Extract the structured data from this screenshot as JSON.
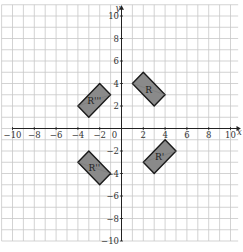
{
  "diagram": {
    "type": "coordinate-grid",
    "x_axis_label": "x",
    "y_axis_label": "y",
    "x_range": [
      -10,
      10
    ],
    "y_range": [
      -10,
      10
    ],
    "x_tick_labels": [
      "−10",
      "−8",
      "−6",
      "−4",
      "−2",
      "0",
      "2",
      "4",
      "6",
      "8",
      "10"
    ],
    "y_tick_labels": [
      "10",
      "8",
      "6",
      "4",
      "2",
      "−2",
      "−4",
      "−6",
      "−8",
      "−10"
    ],
    "shapes": [
      {
        "label": "R",
        "vertices": [
          [
            1,
            4
          ],
          [
            2,
            5
          ],
          [
            4,
            3
          ],
          [
            3,
            2
          ]
        ]
      },
      {
        "label": "R'''",
        "vertices": [
          [
            -4,
            2
          ],
          [
            -2,
            4
          ],
          [
            -1,
            3
          ],
          [
            -3,
            1
          ]
        ]
      },
      {
        "label": "R''",
        "vertices": [
          [
            -4,
            -3
          ],
          [
            -3,
            -2
          ],
          [
            -1,
            -4
          ],
          [
            -2,
            -5
          ]
        ]
      },
      {
        "label": "R'",
        "vertices": [
          [
            2,
            -3
          ],
          [
            4,
            -1
          ],
          [
            5,
            -2
          ],
          [
            3,
            -4
          ]
        ]
      }
    ],
    "colors": {
      "grid": "#c8c8c8",
      "axis": "#222222",
      "shape_fill": "#8a8a8a",
      "shape_stroke": "#1a1a1a"
    }
  }
}
